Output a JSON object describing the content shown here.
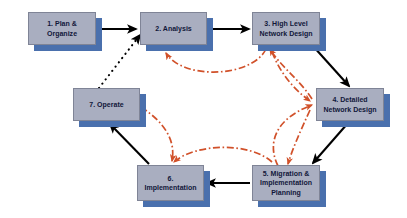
{
  "diagram": {
    "canvas": {
      "width": 407,
      "height": 218,
      "background": "#ffffff"
    },
    "style": {
      "node_fill": "#A9AEC0",
      "node_border": "#7F8496",
      "node_shadow": "#4A70AD",
      "text_color": "#11173A",
      "solid_edge_color": "#000000",
      "dotted_edge_color": "#000000",
      "feedback_edge_color": "#D1512A"
    },
    "nodes": [
      {
        "id": "n1",
        "label": "1. Plan &\nOrganize",
        "x": 28,
        "y": 12,
        "w": 68,
        "h": 33
      },
      {
        "id": "n2",
        "label": "2. Analysis",
        "x": 140,
        "y": 12,
        "w": 67,
        "h": 33
      },
      {
        "id": "n3",
        "label": "3. High Level\nNetwork Design",
        "x": 252,
        "y": 12,
        "w": 68,
        "h": 33
      },
      {
        "id": "n4",
        "label": "4. Detailed\nNetwork Design",
        "x": 316,
        "y": 88,
        "w": 68,
        "h": 33
      },
      {
        "id": "n5",
        "label": "5. Migration &\nImplementation\nPlanning",
        "x": 252,
        "y": 165,
        "w": 68,
        "h": 36
      },
      {
        "id": "n6",
        "label": "6.\nImplementation",
        "x": 137,
        "y": 165,
        "w": 67,
        "h": 36
      },
      {
        "id": "n7",
        "label": "7. Operate",
        "x": 73,
        "y": 88,
        "w": 67,
        "h": 33
      }
    ],
    "edges": [
      {
        "id": "e1",
        "from": "n1",
        "to": "n2",
        "kind": "solid",
        "name": "edge-plan-to-analysis"
      },
      {
        "id": "e2",
        "from": "n2",
        "to": "n3",
        "kind": "solid",
        "name": "edge-analysis-to-high-level-design"
      },
      {
        "id": "e3",
        "from": "n3",
        "to": "n4",
        "kind": "solid",
        "name": "edge-high-level-to-detailed-design"
      },
      {
        "id": "e4",
        "from": "n4",
        "to": "n5",
        "kind": "solid",
        "name": "edge-detailed-design-to-migration"
      },
      {
        "id": "e5",
        "from": "n5",
        "to": "n6",
        "kind": "solid",
        "name": "edge-migration-to-implementation"
      },
      {
        "id": "e6",
        "from": "n6",
        "to": "n7",
        "kind": "solid",
        "name": "edge-implementation-to-operate"
      },
      {
        "id": "e7",
        "from": "n7",
        "to": "n2",
        "kind": "dotted",
        "name": "edge-operate-to-analysis"
      },
      {
        "id": "e8",
        "from": "n3",
        "to": "n2",
        "kind": "feedback",
        "name": "feedback-high-level-to-analysis"
      },
      {
        "id": "e9",
        "from": "n4",
        "to": "n3",
        "kind": "feedback",
        "name": "feedback-detailed-to-high-level"
      },
      {
        "id": "e10",
        "from": "n3",
        "to": "n4",
        "kind": "feedback",
        "name": "feedback-high-level-to-detailed"
      },
      {
        "id": "e11",
        "from": "n5",
        "to": "n4",
        "kind": "feedback",
        "name": "feedback-migration-to-detailed"
      },
      {
        "id": "e12",
        "from": "n4",
        "to": "n5",
        "kind": "feedback",
        "name": "feedback-detailed-to-migration"
      },
      {
        "id": "e13",
        "from": "n5",
        "to": "n6",
        "kind": "feedback",
        "name": "feedback-migration-to-implementation"
      },
      {
        "id": "e14",
        "from": "n7",
        "to": "n6",
        "kind": "feedback",
        "name": "feedback-operate-to-implementation"
      }
    ]
  }
}
